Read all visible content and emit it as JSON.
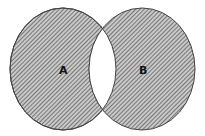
{
  "diagram": {
    "type": "venn",
    "shaded_region": "symmetric difference (A xor B)",
    "sets": [
      {
        "id": "A",
        "label": "A"
      },
      {
        "id": "B",
        "label": "B"
      }
    ],
    "colors": {
      "hatch": "#555555",
      "fill": "#bdbdbd",
      "outline": "#333333",
      "intersection": "#ffffff"
    }
  }
}
